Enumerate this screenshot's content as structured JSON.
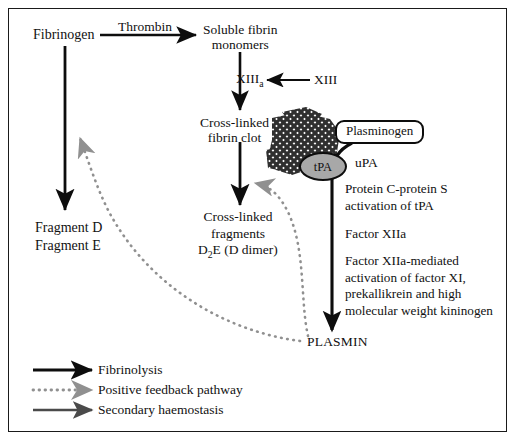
{
  "figure": {
    "border_color": "#1a1a1a",
    "background": "#ffffff"
  },
  "nodes": {
    "fibrinogen": "Fibrinogen",
    "thrombin": "Thrombin",
    "soluble_fibrin_line1": "Soluble fibrin",
    "soluble_fibrin_line2": "monomers",
    "xiiia_base": "XIII",
    "xiiia_sub": "a",
    "xiii": "XIII",
    "clot_line1": "Cross-linked",
    "clot_line2": "fibrin clot",
    "plasminogen": "Plasminogen",
    "tpa": "tPA",
    "upa": "uPA",
    "fragment_d": "Fragment D",
    "fragment_e": "Fragment E",
    "xfrag_line1": "Cross-linked",
    "xfrag_line2": "fragments",
    "xfrag_line3_a": "D",
    "xfrag_line3_sub": "2",
    "xfrag_line3_b": "E (D dimer)",
    "plasmin": "PLASMIN"
  },
  "right_notes": [
    {
      "line1": "Protein C-protein S",
      "line2": "activation of tPA"
    },
    {
      "line1": "Factor XIIa",
      "line2": ""
    },
    {
      "line1": "Factor XIIa-mediated",
      "line2": "activation of factor XI,",
      "line3": "prekallikrein and high",
      "line4": "molecular weight kininogen"
    }
  ],
  "legend": {
    "items": [
      {
        "label": "Fibrinolysis",
        "style": "solid",
        "color": "#0d0d0d"
      },
      {
        "label": "Positive feedback pathway",
        "style": "dotted",
        "color": "#8a8a8a"
      },
      {
        "label": "Secondary haemostasis",
        "style": "solid",
        "color": "#4a4a4a"
      }
    ]
  },
  "colors": {
    "arrow_black": "#0d0d0d",
    "arrow_gray": "#4a4a4a",
    "dotted_gray": "#8a8a8a",
    "clot_mesh": "#3a3a3a",
    "tpa_fill": "#a8a8a8",
    "text": "#111111"
  }
}
